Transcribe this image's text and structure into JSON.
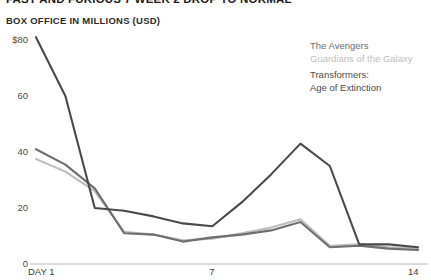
{
  "header": {
    "headline": "FAST AND FURIOUS 7 WEEK 2 DROP TO NORMAL",
    "subtitle": "BOX OFFICE IN MILLIONS (USD)"
  },
  "legend": {
    "position": "top-right",
    "entries": [
      {
        "label": "The Avengers",
        "color": "#6e6e6e"
      },
      {
        "label": "Guardians of the Galaxy",
        "color": "#bdbdbd"
      },
      {
        "label": "Transformers:\nAge of Extinction",
        "color": "#4a4a4a"
      }
    ]
  },
  "chart_data": {
    "type": "line",
    "title": "FAST AND FURIOUS 7 WEEK 2 DROP TO NORMAL",
    "subtitle": "BOX OFFICE IN MILLIONS (USD)",
    "xlabel": "DAY",
    "ylabel": "BOX OFFICE IN MILLIONS (USD)",
    "x": [
      1,
      2,
      3,
      4,
      5,
      6,
      7,
      8,
      9,
      10,
      11,
      12,
      13,
      14
    ],
    "xlim": [
      1,
      14
    ],
    "ylim": [
      0,
      80
    ],
    "xticks": [
      1,
      7,
      14
    ],
    "xticklabels": [
      "DAY 1",
      "7",
      "14"
    ],
    "yticks": [
      0,
      20,
      40,
      60,
      80
    ],
    "yticklabels": [
      "0",
      "20",
      "40",
      "60",
      "$80"
    ],
    "grid": false,
    "zero_axis": true,
    "series": [
      {
        "name": "The Avengers",
        "color": "#6e6e6e",
        "values": [
          41,
          35.5,
          27,
          11,
          10.5,
          8,
          9.5,
          10.5,
          12,
          15,
          6,
          6.5,
          5.5,
          5
        ]
      },
      {
        "name": "Guardians of the Galaxy",
        "color": "#bdbdbd",
        "values": [
          37.5,
          33,
          26,
          11.5,
          10.5,
          8.5,
          9,
          11,
          13,
          16,
          6.5,
          7,
          6,
          5.5
        ]
      },
      {
        "name": "Transformers: Age of Extinction",
        "color": "#4a4a4a",
        "values": [
          81,
          60,
          20,
          19,
          17,
          14.5,
          13.5,
          22,
          32,
          43,
          35,
          7,
          7,
          6
        ]
      }
    ]
  }
}
